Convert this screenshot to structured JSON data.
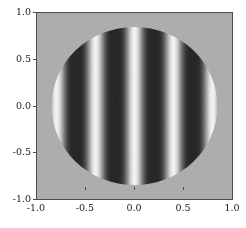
{
  "figure": {
    "background_color": "#ffffff",
    "axes_background_color": "#ababab",
    "frame_color": "#4d4d4d"
  },
  "chart_data": {
    "type": "heatmap",
    "title": "",
    "xlabel": "",
    "ylabel": "",
    "xlim": [
      -1.0,
      1.0
    ],
    "ylim": [
      -1.0,
      1.0
    ],
    "grid": false,
    "legend": "none",
    "colormap": "gray",
    "aperture": {
      "shape": "circle",
      "center_x": 0.0,
      "center_y": 0.0,
      "radius": 0.85
    },
    "pattern": {
      "orientation": "vertical",
      "period_x": 0.4,
      "phase_x": 0.0,
      "bright_fringe_centers_x": [
        -0.8,
        -0.4,
        0.0,
        0.4,
        0.8
      ],
      "dark_fringe_centers_x": [
        -0.6,
        -0.2,
        0.2,
        0.6
      ],
      "value_min": 0.0,
      "value_max": 1.0,
      "outside_value": 0.5
    },
    "colors": {
      "dark": "#262626",
      "mid": "#ababab",
      "bright": "#f2f2f2",
      "outside": "#ababab"
    },
    "xticks": [
      -1.0,
      -0.5,
      0.0,
      0.5,
      1.0
    ],
    "yticks": [
      -1.0,
      -0.5,
      0.0,
      0.5,
      1.0
    ],
    "xticklabels": [
      "-1.0",
      "-0.5",
      "0.0",
      "0.5",
      "1.0"
    ],
    "yticklabels": [
      "-1.0",
      "-0.5",
      "0.0",
      "0.5",
      "1.0"
    ]
  },
  "axis": {
    "x": {
      "ticks": [
        {
          "value": -1.0,
          "label": "-1.0",
          "pos_pct": 0
        },
        {
          "value": -0.5,
          "label": "-0.5",
          "pos_pct": 25
        },
        {
          "value": 0.0,
          "label": "0.0",
          "pos_pct": 50
        },
        {
          "value": 0.5,
          "label": "0.5",
          "pos_pct": 75
        },
        {
          "value": 1.0,
          "label": "1.0",
          "pos_pct": 100
        }
      ]
    },
    "y": {
      "ticks": [
        {
          "value": 1.0,
          "label": "1.0",
          "pos_pct": 0
        },
        {
          "value": 0.5,
          "label": "0.5",
          "pos_pct": 25
        },
        {
          "value": 0.0,
          "label": "0.0",
          "pos_pct": 50
        },
        {
          "value": -0.5,
          "label": "-0.5",
          "pos_pct": 75
        },
        {
          "value": -1.0,
          "label": "-1.0",
          "pos_pct": 100
        }
      ]
    }
  }
}
